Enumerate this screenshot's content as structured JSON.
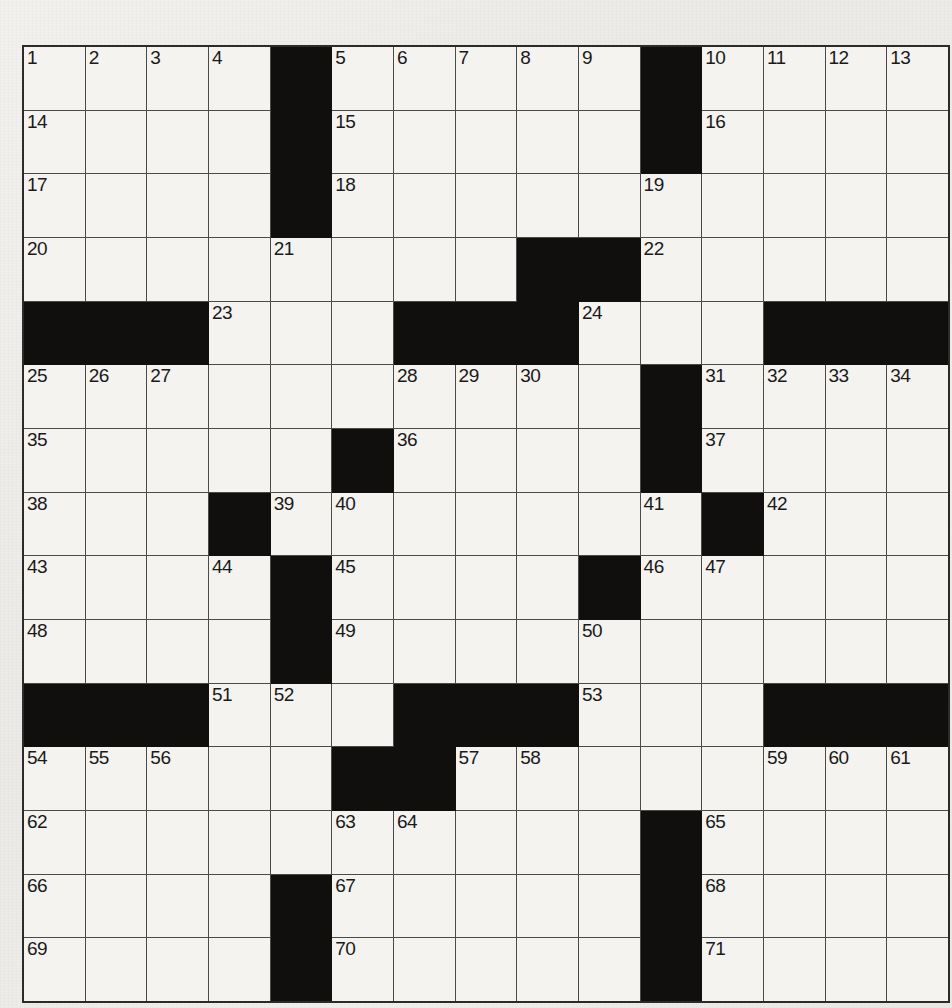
{
  "puzzle": {
    "type": "crossword-grid",
    "title": "Crossword Puzzle Grid",
    "rows": 15,
    "columns": 15,
    "cell_colors": {
      "open": "#f4f3f0",
      "block": "#100f0d",
      "grid_line": "#4a4a4a",
      "border": "#2b2b2b",
      "page_background": "#efefec",
      "number_text": "#1a1a1a"
    },
    "highest_clue_number": 71,
    "entry_counts": {
      "across": 38,
      "down": 33
    },
    "grid": [
      [
        "1",
        "2",
        "3",
        "4",
        "#",
        "5",
        "6",
        "7",
        "8",
        "9",
        "#",
        "10",
        "11",
        "12",
        "13"
      ],
      [
        "14",
        "",
        "",
        "",
        "#",
        "15",
        "",
        "",
        "",
        "",
        "#",
        "16",
        "",
        "",
        ""
      ],
      [
        "17",
        "",
        "",
        "",
        "#",
        "18",
        "",
        "",
        "",
        "",
        "19",
        "",
        "",
        "",
        ""
      ],
      [
        "20",
        "",
        "",
        "",
        "21",
        "",
        "",
        "",
        "#",
        "#",
        "22",
        "",
        "",
        "",
        ""
      ],
      [
        "#",
        "#",
        "#",
        "23",
        "",
        "",
        "#",
        "#",
        "#",
        "24",
        "",
        "",
        "#",
        "#",
        "#"
      ],
      [
        "25",
        "26",
        "27",
        "",
        "",
        "",
        "28",
        "29",
        "30",
        "",
        "#",
        "31",
        "32",
        "33",
        "34"
      ],
      [
        "35",
        "",
        "",
        "",
        "",
        "#",
        "36",
        "",
        "",
        "",
        "#",
        "37",
        "",
        "",
        ""
      ],
      [
        "38",
        "",
        "",
        "#",
        "39",
        "40",
        "",
        "",
        "",
        "",
        "41",
        "#",
        "42",
        "",
        ""
      ],
      [
        "43",
        "",
        "",
        "44",
        "#",
        "45",
        "",
        "",
        "",
        "#",
        "46",
        "47",
        "",
        "",
        ""
      ],
      [
        "48",
        "",
        "",
        "",
        "#",
        "49",
        "",
        "",
        "",
        "50",
        "",
        "",
        "",
        "",
        ""
      ],
      [
        "#",
        "#",
        "#",
        "51",
        "52",
        "",
        "#",
        "#",
        "#",
        "53",
        "",
        "",
        "#",
        "#",
        "#"
      ],
      [
        "54",
        "55",
        "56",
        "",
        "",
        "#",
        "#",
        "57",
        "58",
        "",
        "",
        "",
        "59",
        "60",
        "61"
      ],
      [
        "62",
        "",
        "",
        "",
        "",
        "63",
        "64",
        "",
        "",
        "",
        "#",
        "65",
        "",
        "",
        ""
      ],
      [
        "66",
        "",
        "",
        "",
        "#",
        "67",
        "",
        "",
        "",
        "",
        "#",
        "68",
        "",
        "",
        ""
      ],
      [
        "69",
        "",
        "",
        "",
        "#",
        "70",
        "",
        "",
        "",
        "",
        "#",
        "71",
        "",
        "",
        ""
      ]
    ],
    "numbered_cells": [
      {
        "n": "1",
        "row": 0,
        "col": 0
      },
      {
        "n": "2",
        "row": 0,
        "col": 1
      },
      {
        "n": "3",
        "row": 0,
        "col": 2
      },
      {
        "n": "4",
        "row": 0,
        "col": 3
      },
      {
        "n": "5",
        "row": 0,
        "col": 5
      },
      {
        "n": "6",
        "row": 0,
        "col": 6
      },
      {
        "n": "7",
        "row": 0,
        "col": 7
      },
      {
        "n": "8",
        "row": 0,
        "col": 8
      },
      {
        "n": "9",
        "row": 0,
        "col": 9
      },
      {
        "n": "10",
        "row": 0,
        "col": 11
      },
      {
        "n": "11",
        "row": 0,
        "col": 12
      },
      {
        "n": "12",
        "row": 0,
        "col": 13
      },
      {
        "n": "13",
        "row": 0,
        "col": 14
      },
      {
        "n": "14",
        "row": 1,
        "col": 0
      },
      {
        "n": "15",
        "row": 1,
        "col": 5
      },
      {
        "n": "16",
        "row": 1,
        "col": 11
      },
      {
        "n": "17",
        "row": 2,
        "col": 0
      },
      {
        "n": "18",
        "row": 2,
        "col": 5
      },
      {
        "n": "19",
        "row": 2,
        "col": 10
      },
      {
        "n": "20",
        "row": 3,
        "col": 0
      },
      {
        "n": "21",
        "row": 3,
        "col": 4
      },
      {
        "n": "22",
        "row": 3,
        "col": 10
      },
      {
        "n": "23",
        "row": 4,
        "col": 3
      },
      {
        "n": "24",
        "row": 4,
        "col": 9
      },
      {
        "n": "25",
        "row": 5,
        "col": 0
      },
      {
        "n": "26",
        "row": 5,
        "col": 1
      },
      {
        "n": "27",
        "row": 5,
        "col": 2
      },
      {
        "n": "28",
        "row": 5,
        "col": 6
      },
      {
        "n": "29",
        "row": 5,
        "col": 7
      },
      {
        "n": "30",
        "row": 5,
        "col": 8
      },
      {
        "n": "31",
        "row": 5,
        "col": 11
      },
      {
        "n": "32",
        "row": 5,
        "col": 12
      },
      {
        "n": "33",
        "row": 5,
        "col": 13
      },
      {
        "n": "34",
        "row": 5,
        "col": 14
      },
      {
        "n": "35",
        "row": 6,
        "col": 0
      },
      {
        "n": "36",
        "row": 6,
        "col": 6
      },
      {
        "n": "37",
        "row": 6,
        "col": 11
      },
      {
        "n": "38",
        "row": 7,
        "col": 0
      },
      {
        "n": "39",
        "row": 7,
        "col": 4
      },
      {
        "n": "40",
        "row": 7,
        "col": 5
      },
      {
        "n": "41",
        "row": 7,
        "col": 10
      },
      {
        "n": "42",
        "row": 7,
        "col": 12
      },
      {
        "n": "43",
        "row": 8,
        "col": 0
      },
      {
        "n": "44",
        "row": 8,
        "col": 3
      },
      {
        "n": "45",
        "row": 8,
        "col": 5
      },
      {
        "n": "46",
        "row": 8,
        "col": 10
      },
      {
        "n": "47",
        "row": 8,
        "col": 11
      },
      {
        "n": "48",
        "row": 9,
        "col": 0
      },
      {
        "n": "49",
        "row": 9,
        "col": 5
      },
      {
        "n": "50",
        "row": 9,
        "col": 9
      },
      {
        "n": "51",
        "row": 10,
        "col": 3
      },
      {
        "n": "52",
        "row": 10,
        "col": 4
      },
      {
        "n": "53",
        "row": 10,
        "col": 9
      },
      {
        "n": "54",
        "row": 11,
        "col": 0
      },
      {
        "n": "55",
        "row": 11,
        "col": 1
      },
      {
        "n": "56",
        "row": 11,
        "col": 2
      },
      {
        "n": "57",
        "row": 11,
        "col": 7
      },
      {
        "n": "58",
        "row": 11,
        "col": 8
      },
      {
        "n": "59",
        "row": 11,
        "col": 12
      },
      {
        "n": "60",
        "row": 11,
        "col": 13
      },
      {
        "n": "61",
        "row": 11,
        "col": 14
      },
      {
        "n": "62",
        "row": 12,
        "col": 0
      },
      {
        "n": "63",
        "row": 12,
        "col": 5
      },
      {
        "n": "64",
        "row": 12,
        "col": 6
      },
      {
        "n": "65",
        "row": 12,
        "col": 11
      },
      {
        "n": "66",
        "row": 13,
        "col": 0
      },
      {
        "n": "67",
        "row": 13,
        "col": 5
      },
      {
        "n": "68",
        "row": 13,
        "col": 11
      },
      {
        "n": "69",
        "row": 14,
        "col": 0
      },
      {
        "n": "70",
        "row": 14,
        "col": 5
      },
      {
        "n": "71",
        "row": 14,
        "col": 11
      }
    ],
    "block_cells": [
      {
        "row": 0,
        "col": 4
      },
      {
        "row": 0,
        "col": 10
      },
      {
        "row": 1,
        "col": 4
      },
      {
        "row": 1,
        "col": 10
      },
      {
        "row": 2,
        "col": 4
      },
      {
        "row": 3,
        "col": 8
      },
      {
        "row": 3,
        "col": 9
      },
      {
        "row": 4,
        "col": 0
      },
      {
        "row": 4,
        "col": 1
      },
      {
        "row": 4,
        "col": 2
      },
      {
        "row": 4,
        "col": 6
      },
      {
        "row": 4,
        "col": 7
      },
      {
        "row": 4,
        "col": 8
      },
      {
        "row": 4,
        "col": 12
      },
      {
        "row": 4,
        "col": 13
      },
      {
        "row": 4,
        "col": 14
      },
      {
        "row": 5,
        "col": 10
      },
      {
        "row": 6,
        "col": 5
      },
      {
        "row": 6,
        "col": 10
      },
      {
        "row": 7,
        "col": 3
      },
      {
        "row": 7,
        "col": 11
      },
      {
        "row": 8,
        "col": 4
      },
      {
        "row": 8,
        "col": 9
      },
      {
        "row": 9,
        "col": 4
      },
      {
        "row": 10,
        "col": 0
      },
      {
        "row": 10,
        "col": 1
      },
      {
        "row": 10,
        "col": 2
      },
      {
        "row": 10,
        "col": 6
      },
      {
        "row": 10,
        "col": 7
      },
      {
        "row": 10,
        "col": 8
      },
      {
        "row": 10,
        "col": 12
      },
      {
        "row": 10,
        "col": 13
      },
      {
        "row": 10,
        "col": 14
      },
      {
        "row": 11,
        "col": 5
      },
      {
        "row": 11,
        "col": 6
      },
      {
        "row": 12,
        "col": 10
      },
      {
        "row": 13,
        "col": 4
      },
      {
        "row": 13,
        "col": 10
      },
      {
        "row": 14,
        "col": 4
      },
      {
        "row": 14,
        "col": 10
      }
    ]
  }
}
